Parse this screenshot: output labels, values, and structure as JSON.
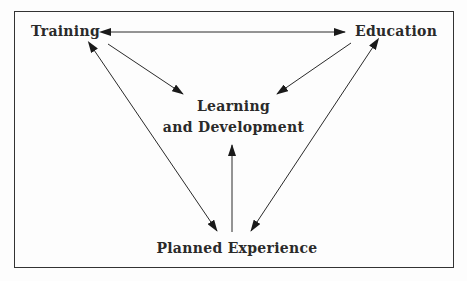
{
  "diagram": {
    "nodes": {
      "training": "Training",
      "education": "Education",
      "learning_line1": "Learning",
      "learning_line2": "and Development",
      "planned": "Planned Experience"
    },
    "edges": [
      {
        "from": "Training",
        "to": "Education",
        "type": "bidirectional"
      },
      {
        "from": "Training",
        "to": "Learning and Development",
        "type": "directed"
      },
      {
        "from": "Education",
        "to": "Learning and Development",
        "type": "directed"
      },
      {
        "from": "Planned Experience",
        "to": "Learning and Development",
        "type": "directed"
      },
      {
        "from": "Training",
        "to": "Planned Experience",
        "type": "bidirectional"
      },
      {
        "from": "Education",
        "to": "Planned Experience",
        "type": "bidirectional"
      }
    ],
    "colors": {
      "line": "#2a2a2a",
      "background": "#fdfdfd"
    }
  }
}
